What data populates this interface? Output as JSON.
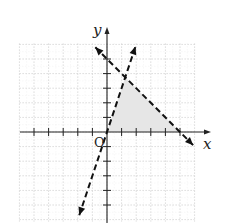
{
  "chart_data": {
    "type": "line",
    "title": "",
    "xlabel": "x",
    "ylabel": "y",
    "origin_label": "O",
    "xlim": [
      -6,
      6
    ],
    "ylim": [
      -6,
      6
    ],
    "grid": true,
    "tick_step": 1,
    "series": [
      {
        "name": "boundary-1",
        "equation": "y = -x + 5",
        "style": "dashed",
        "points": [
          [
            -0.8,
            5.8
          ],
          [
            0,
            5
          ],
          [
            5,
            0
          ],
          [
            5.9,
            -0.9
          ]
        ],
        "arrows": "both"
      },
      {
        "name": "boundary-2",
        "equation": "y = 3x",
        "style": "dashed",
        "points": [
          [
            -1.9,
            -5.7
          ],
          [
            0,
            0
          ],
          [
            1.25,
            3.75
          ],
          [
            1.95,
            5.85
          ]
        ],
        "arrows": "both"
      }
    ],
    "shaded_region": {
      "description": "feasible region bounded by y>0 (x-axis), y<3x, y<-x+5",
      "vertices": [
        [
          0,
          0
        ],
        [
          1.25,
          3.75
        ],
        [
          5,
          0
        ]
      ],
      "color": "#e6e6e6"
    },
    "colors": {
      "grid": "#d0d0d0",
      "axis": "#222222",
      "line": "#111111",
      "shade": "#e6e6e6"
    }
  }
}
